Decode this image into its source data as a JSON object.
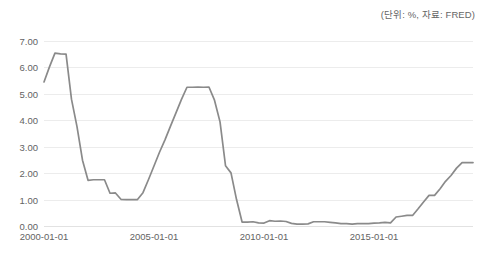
{
  "header": {
    "unit_note": "(단위: %, 자료: FRED)"
  },
  "axis": {
    "y_ticks": [
      "7.00",
      "6.00",
      "5.00",
      "4.00",
      "3.00",
      "2.00",
      "1.00",
      "0.00"
    ],
    "x_ticks": [
      "2000-01-01",
      "2005-01-01",
      "2010-01-01",
      "2015-01-01"
    ]
  },
  "style": {
    "line_color": "#8a8a8a",
    "grid_color": "#ececec",
    "text_color": "#636363"
  },
  "chart_data": {
    "type": "line",
    "title": "",
    "subtitle": "",
    "xlabel": "",
    "ylabel": "",
    "unit": "%",
    "source": "FRED",
    "grid": "horizontal",
    "legend": "none",
    "ylim": [
      0.0,
      7.0
    ],
    "ytick_step": 1.0,
    "xlim": [
      "2000-01-01",
      "2019-07-01"
    ],
    "xtick_labels": [
      "2000-01-01",
      "2005-01-01",
      "2010-01-01",
      "2015-01-01"
    ],
    "series": [
      {
        "name": "Federal Funds Effective Rate",
        "x": [
          "2000-01-01",
          "2000-04-01",
          "2000-07-01",
          "2000-10-01",
          "2001-01-01",
          "2001-04-01",
          "2001-07-01",
          "2001-10-01",
          "2002-01-01",
          "2002-04-01",
          "2002-07-01",
          "2002-10-01",
          "2003-01-01",
          "2003-04-01",
          "2003-07-01",
          "2003-10-01",
          "2004-01-01",
          "2004-04-01",
          "2004-07-01",
          "2004-10-01",
          "2005-01-01",
          "2005-04-01",
          "2005-07-01",
          "2005-10-01",
          "2006-01-01",
          "2006-04-01",
          "2006-07-01",
          "2006-10-01",
          "2007-01-01",
          "2007-04-01",
          "2007-07-01",
          "2007-10-01",
          "2008-01-01",
          "2008-04-01",
          "2008-07-01",
          "2008-10-01",
          "2009-01-01",
          "2009-04-01",
          "2009-07-01",
          "2009-10-01",
          "2010-01-01",
          "2010-04-01",
          "2010-07-01",
          "2010-10-01",
          "2011-01-01",
          "2011-04-01",
          "2011-07-01",
          "2011-10-01",
          "2012-01-01",
          "2012-04-01",
          "2012-07-01",
          "2012-10-01",
          "2013-01-01",
          "2013-04-01",
          "2013-07-01",
          "2013-10-01",
          "2014-01-01",
          "2014-04-01",
          "2014-07-01",
          "2014-10-01",
          "2015-01-01",
          "2015-04-01",
          "2015-07-01",
          "2015-10-01",
          "2016-01-01",
          "2016-04-01",
          "2016-07-01",
          "2016-10-01",
          "2017-01-01",
          "2017-04-01",
          "2017-07-01",
          "2017-10-01",
          "2018-01-01",
          "2018-04-01",
          "2018-07-01",
          "2018-10-01",
          "2019-01-01",
          "2019-04-01",
          "2019-07-01"
        ],
        "values": [
          5.45,
          6.02,
          6.54,
          6.51,
          6.5,
          4.8,
          3.77,
          2.49,
          1.73,
          1.75,
          1.75,
          1.75,
          1.24,
          1.25,
          1.01,
          1.0,
          1.0,
          1.0,
          1.26,
          1.76,
          2.28,
          2.79,
          3.26,
          3.78,
          4.29,
          4.79,
          5.25,
          5.25,
          5.26,
          5.25,
          5.26,
          4.76,
          3.94,
          2.28,
          2.01,
          1.0,
          0.15,
          0.15,
          0.16,
          0.12,
          0.11,
          0.2,
          0.18,
          0.19,
          0.17,
          0.1,
          0.07,
          0.07,
          0.08,
          0.16,
          0.16,
          0.16,
          0.14,
          0.12,
          0.09,
          0.09,
          0.07,
          0.09,
          0.09,
          0.09,
          0.11,
          0.12,
          0.14,
          0.12,
          0.34,
          0.37,
          0.4,
          0.4,
          0.65,
          0.91,
          1.16,
          1.16,
          1.41,
          1.69,
          1.91,
          2.19,
          2.4,
          2.4,
          2.4
        ]
      }
    ]
  }
}
